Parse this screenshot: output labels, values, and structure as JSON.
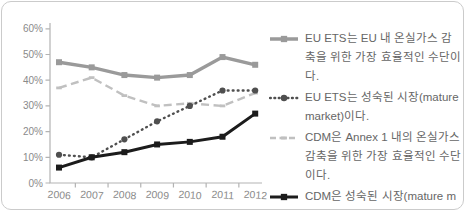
{
  "card": {
    "background": "#ffffff",
    "border_color": "#cbcbcb"
  },
  "chart_data": {
    "type": "line",
    "categories": [
      "2006",
      "2007",
      "2008",
      "2009",
      "2010",
      "2011",
      "2012"
    ],
    "series": [
      {
        "name": "EU ETS는 EU 내 온실가스 감축을 위한 가장 효율적인 수단이다.",
        "values": [
          47,
          45,
          42,
          41,
          42,
          49,
          46
        ],
        "color": "#9a9a9a",
        "line_style": "solid",
        "marker": "square",
        "line_width": 3.4
      },
      {
        "name": "EU ETS는 성숙된 시장(mature market)이다.",
        "values": [
          11,
          10,
          17,
          24,
          30,
          36,
          36
        ],
        "color": "#4f4f4f",
        "line_style": "dotted",
        "marker": "circle",
        "line_width": 2.4
      },
      {
        "name": "CDM은 Annex 1 내의 온실가스 감축을 위한 가장 효율적인 수단이다.",
        "values": [
          37,
          41,
          34,
          30,
          31,
          30,
          35
        ],
        "color": "#c0c0c0",
        "line_style": "dashed",
        "marker": "dash",
        "line_width": 2.4
      },
      {
        "name": "CDM은 성숙된 시장(mature market)이다.",
        "values": [
          6,
          10,
          12,
          15,
          16,
          18,
          27
        ],
        "color": "#1c1c1c",
        "line_style": "solid",
        "marker": "square",
        "line_width": 3
      }
    ],
    "ylabel_ticks": [
      "0%",
      "10%",
      "20%",
      "30%",
      "40%",
      "50%",
      "60%"
    ],
    "ylim": [
      0,
      60
    ],
    "y_tick_step": 10,
    "grid": false,
    "legend_position": "right"
  },
  "style": {
    "axis_color": "#b3b3b3",
    "tick_label_color": "#8a8a8a",
    "legend_text_color": "#666666"
  }
}
